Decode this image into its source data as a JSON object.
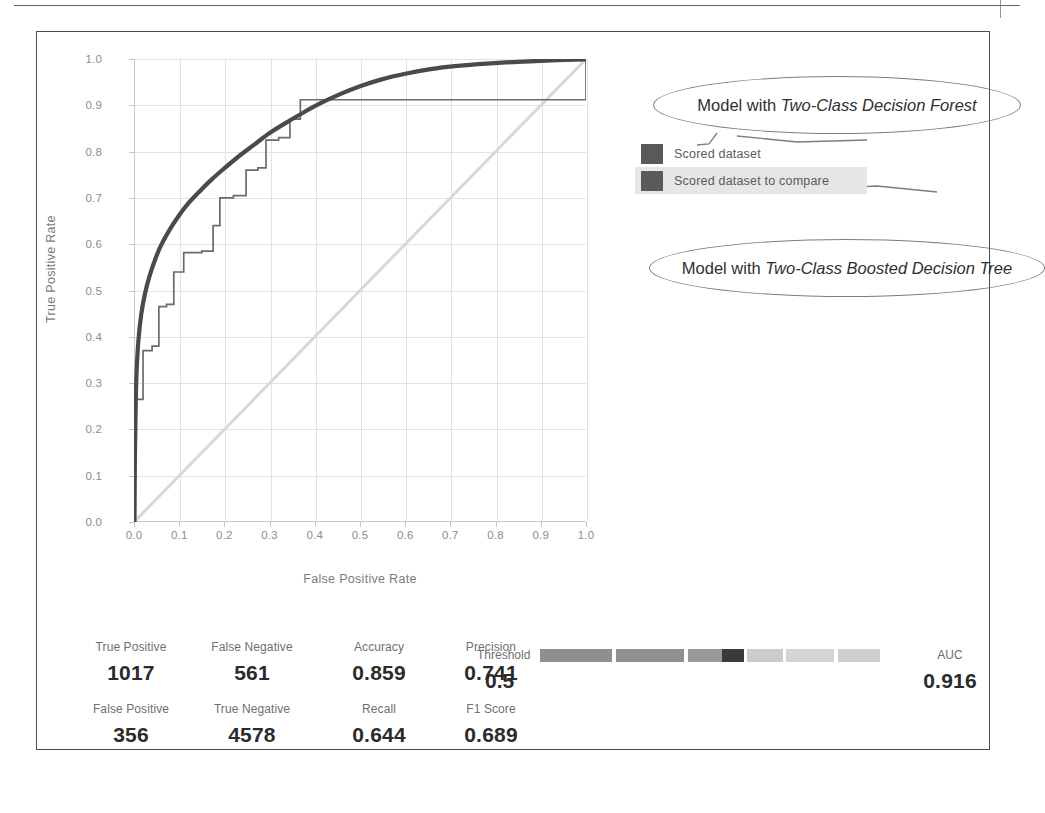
{
  "chart_data": {
    "type": "line",
    "title": "",
    "xlabel": "False Positive Rate",
    "ylabel": "True Positive Rate",
    "xlim": [
      0.0,
      1.0
    ],
    "ylim": [
      0.0,
      1.0
    ],
    "xticks": [
      "0.0",
      "0.1",
      "0.2",
      "0.3",
      "0.4",
      "0.5",
      "0.6",
      "0.7",
      "0.8",
      "0.9",
      "1.0"
    ],
    "yticks": [
      "0.0",
      "0.1",
      "0.2",
      "0.3",
      "0.4",
      "0.5",
      "0.6",
      "0.7",
      "0.8",
      "0.9",
      "1.0"
    ],
    "grid": true,
    "legend_position": "right",
    "series": [
      {
        "name": "Scored dataset",
        "color": "#4a4a4a",
        "style": "smooth-thick",
        "points": [
          [
            0.0,
            0.0
          ],
          [
            0.002,
            0.14
          ],
          [
            0.004,
            0.265
          ],
          [
            0.006,
            0.33
          ],
          [
            0.01,
            0.395
          ],
          [
            0.016,
            0.448
          ],
          [
            0.024,
            0.492
          ],
          [
            0.034,
            0.53
          ],
          [
            0.046,
            0.565
          ],
          [
            0.06,
            0.598
          ],
          [
            0.078,
            0.63
          ],
          [
            0.098,
            0.66
          ],
          [
            0.12,
            0.688
          ],
          [
            0.145,
            0.714
          ],
          [
            0.172,
            0.74
          ],
          [
            0.2,
            0.764
          ],
          [
            0.232,
            0.79
          ],
          [
            0.266,
            0.815
          ],
          [
            0.3,
            0.84
          ],
          [
            0.336,
            0.862
          ],
          [
            0.374,
            0.884
          ],
          [
            0.414,
            0.905
          ],
          [
            0.456,
            0.924
          ],
          [
            0.5,
            0.941
          ],
          [
            0.548,
            0.956
          ],
          [
            0.6,
            0.968
          ],
          [
            0.656,
            0.978
          ],
          [
            0.716,
            0.985
          ],
          [
            0.78,
            0.99
          ],
          [
            0.85,
            0.994
          ],
          [
            0.925,
            0.997
          ],
          [
            1.0,
            0.999
          ]
        ]
      },
      {
        "name": "Scored dataset to compare",
        "color": "#6b6b6b",
        "style": "step-thin",
        "points": [
          [
            0.0,
            0.0
          ],
          [
            0.004,
            0.0
          ],
          [
            0.004,
            0.265
          ],
          [
            0.02,
            0.265
          ],
          [
            0.02,
            0.37
          ],
          [
            0.04,
            0.37
          ],
          [
            0.04,
            0.38
          ],
          [
            0.055,
            0.38
          ],
          [
            0.055,
            0.465
          ],
          [
            0.072,
            0.465
          ],
          [
            0.072,
            0.47
          ],
          [
            0.088,
            0.47
          ],
          [
            0.088,
            0.54
          ],
          [
            0.11,
            0.54
          ],
          [
            0.11,
            0.582
          ],
          [
            0.15,
            0.582
          ],
          [
            0.15,
            0.585
          ],
          [
            0.175,
            0.585
          ],
          [
            0.175,
            0.64
          ],
          [
            0.19,
            0.64
          ],
          [
            0.19,
            0.7
          ],
          [
            0.22,
            0.7
          ],
          [
            0.22,
            0.705
          ],
          [
            0.248,
            0.705
          ],
          [
            0.248,
            0.76
          ],
          [
            0.274,
            0.76
          ],
          [
            0.274,
            0.765
          ],
          [
            0.292,
            0.765
          ],
          [
            0.292,
            0.825
          ],
          [
            0.32,
            0.825
          ],
          [
            0.32,
            0.83
          ],
          [
            0.345,
            0.83
          ],
          [
            0.345,
            0.87
          ],
          [
            0.368,
            0.87
          ],
          [
            0.368,
            0.912
          ],
          [
            1.0,
            0.912
          ],
          [
            1.0,
            1.0
          ]
        ]
      },
      {
        "name": "random-reference-diagonal",
        "color": "#d8d8d8",
        "style": "diagonal",
        "points": [
          [
            0.0,
            0.0
          ],
          [
            1.0,
            1.0
          ]
        ]
      }
    ]
  },
  "legend": {
    "items": [
      {
        "label": "Scored dataset",
        "color": "#595959",
        "highlighted": false
      },
      {
        "label": "Scored dataset to compare",
        "color": "#5a5a5a",
        "highlighted": true
      }
    ]
  },
  "annotations": {
    "top": {
      "prefix": "Model with ",
      "emphasis": "Two-Class Decision Forest"
    },
    "bottom": {
      "prefix": "Model with ",
      "emphasis": "Two-Class Boosted Decision Tree"
    }
  },
  "metrics": {
    "row1": [
      {
        "label": "True Positive",
        "value": "1017"
      },
      {
        "label": "False Negative",
        "value": "561"
      },
      {
        "label": "Accuracy",
        "value": "0.859"
      },
      {
        "label": "Precision",
        "value": "0.741"
      }
    ],
    "row2": [
      {
        "label": "False Positive",
        "value": "356"
      },
      {
        "label": "True Negative",
        "value": "4578"
      },
      {
        "label": "Recall",
        "value": "0.644"
      },
      {
        "label": "F1 Score",
        "value": "0.689"
      }
    ],
    "threshold": {
      "label": "Threshold",
      "value": "0.5"
    },
    "auc": {
      "label": "AUC",
      "value": "0.916"
    }
  },
  "threshold_slider": {
    "segments": [
      {
        "width": 72,
        "color": "#8f8f8f"
      },
      {
        "width": 4,
        "color": "#ffffff"
      },
      {
        "width": 68,
        "color": "#909090"
      },
      {
        "width": 4,
        "color": "#ffffff"
      },
      {
        "width": 34,
        "color": "#999999"
      },
      {
        "width": 22,
        "color": "#3a3a3a"
      },
      {
        "width": 3,
        "color": "#ffffff"
      },
      {
        "width": 36,
        "color": "#cccccc"
      },
      {
        "width": 3,
        "color": "#ffffff"
      },
      {
        "width": 48,
        "color": "#d4d4d4"
      },
      {
        "width": 4,
        "color": "#ffffff"
      },
      {
        "width": 42,
        "color": "#cfcfcf"
      }
    ]
  }
}
